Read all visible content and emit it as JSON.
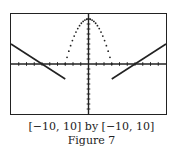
{
  "chart_data": {
    "type": "line",
    "title": "",
    "window": {
      "xmin": -10,
      "xmax": 10,
      "ymin": -10,
      "ymax": 10
    },
    "axes": {
      "ticks_x": 1,
      "ticks_y": 1,
      "grid": false
    },
    "series": [
      {
        "name": "piecewise-left-line",
        "style": "solid",
        "equation": "y = -x - 6",
        "domain": [
          -10,
          -3
        ],
        "points": [
          [
            -10,
            4
          ],
          [
            -6,
            0
          ],
          [
            -3,
            -3
          ]
        ]
      },
      {
        "name": "piecewise-parabola",
        "style": "dotted",
        "equation": "y = 9 - x^2",
        "domain": [
          -3,
          3
        ],
        "points": [
          [
            -3,
            0
          ],
          [
            -2,
            5
          ],
          [
            -1,
            8
          ],
          [
            0,
            9
          ],
          [
            1,
            8
          ],
          [
            2,
            5
          ],
          [
            3,
            0
          ]
        ]
      },
      {
        "name": "piecewise-right-line",
        "style": "solid",
        "equation": "y = x - 6",
        "domain": [
          3,
          10
        ],
        "points": [
          [
            3,
            -3
          ],
          [
            6,
            0
          ],
          [
            10,
            4
          ]
        ]
      }
    ],
    "xlabel": "",
    "ylabel": "",
    "xlim": [
      -10,
      10
    ],
    "ylim": [
      -10,
      10
    ]
  },
  "caption": {
    "window_text": "[−10, 10] by [−10, 10]",
    "figure_label": "Figure 7"
  },
  "colors": {
    "ink": "#222222",
    "background": "#ffffff"
  }
}
